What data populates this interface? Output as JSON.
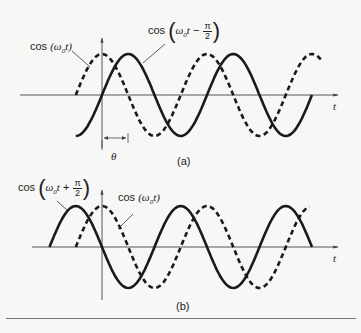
{
  "chart_data": [
    {
      "type": "line",
      "panel": "(a)",
      "caption": "(a)",
      "xlabel": "t",
      "ylabel": "",
      "series": [
        {
          "name": "cos (ω0t)",
          "style": "dashed",
          "phase_shift": "0",
          "peaks_at_t": [
            0,
            2
          ],
          "troughs_at_t": [
            1,
            3
          ]
        },
        {
          "name": "cos (ω0t − π/2)",
          "style": "solid",
          "phase_shift": "-π/2",
          "peaks_at_t": [
            0.5,
            2.5
          ],
          "troughs_at_t": [
            -0.5,
            1.5,
            3.5
          ]
        }
      ],
      "annotations": [
        "θ"
      ],
      "x_units": "half periods",
      "grid": false
    },
    {
      "type": "line",
      "panel": "(b)",
      "caption": "(b)",
      "xlabel": "t",
      "ylabel": "",
      "series": [
        {
          "name": "cos (ω0t + π/2)",
          "style": "solid",
          "phase_shift": "+π/2",
          "peaks_at_t": [
            -0.5,
            1.5,
            3.5
          ],
          "troughs_at_t": [
            0.5,
            2.5
          ]
        },
        {
          "name": "cos (ω0t)",
          "style": "dashed",
          "phase_shift": "0",
          "peaks_at_t": [
            0,
            2
          ],
          "troughs_at_t": [
            1,
            3
          ]
        }
      ],
      "annotations": [],
      "x_units": "half periods",
      "grid": false
    }
  ],
  "panel_a": {
    "label_dashed": {
      "fn": "cos",
      "arg": "(ω",
      "sub": "0",
      "t": "t)"
    },
    "label_solid": {
      "fn": "cos",
      "w": "ω",
      "sub": "0",
      "t": "t",
      "op": "−",
      "num": "π",
      "den": "2"
    },
    "theta": "θ",
    "axis_t": "t",
    "caption": "(a)"
  },
  "panel_b": {
    "label_solid": {
      "fn": "cos",
      "w": "ω",
      "sub": "0",
      "t": "t",
      "op": "+",
      "num": "π",
      "den": "2"
    },
    "label_dashed": {
      "fn": "cos",
      "arg": "(ω",
      "sub": "0",
      "t": "t)"
    },
    "axis_t": "t",
    "caption": "(b)"
  },
  "colors": {
    "curve": "#1a1a1a",
    "axis": "#444444",
    "background": "#f7f7f6"
  }
}
